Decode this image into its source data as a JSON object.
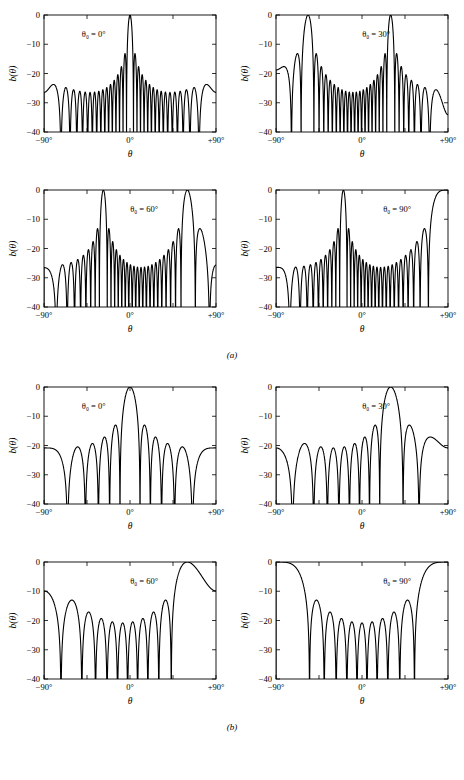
{
  "figure": {
    "caption_a": "(a)",
    "caption_b": "(b)",
    "axis": {
      "ylabel": "b(θ)",
      "xlabel": "θ",
      "yticks": [
        "0",
        "−10",
        "−20",
        "−30",
        "−40"
      ],
      "ytick_values": [
        0,
        -10,
        -20,
        -30,
        -40
      ],
      "xticks": [
        "−90°",
        "0°",
        "+90°"
      ],
      "xtick_values": [
        -90,
        0,
        90
      ],
      "xtick_minor_values": [
        -45,
        45
      ],
      "ylim": [
        -40,
        0
      ],
      "xlim": [
        -90,
        90
      ],
      "line_color": "#000000",
      "frame_color": "#000000"
    },
    "annotations": {
      "theta0_0": "θ₀ = 0°",
      "theta0_30": "θ₀ = 30°",
      "theta0_60": "θ₀ = 60°",
      "theta0_90": "θ₀ = 90°"
    }
  },
  "chart_data": [
    {
      "id": "a-0",
      "type": "line",
      "group": "a",
      "title": "θ₀ = 0°",
      "xlabel": "θ",
      "ylabel": "b(θ)",
      "xlim": [
        -90,
        90
      ],
      "ylim": [
        -40,
        0
      ],
      "grid": false,
      "legend": "none",
      "steer_deg": 0,
      "n_elements": 21,
      "spacing_lambda": 0.75,
      "peak_db": 0,
      "first_sidelobe_db": -13,
      "mainlobe_centers_deg": [
        0
      ],
      "grating_lobe_centers_deg": [
        -78,
        78
      ],
      "sidelobe_peaks_db": [
        -13,
        -17,
        -18.5,
        -19.5,
        -20,
        -20.5,
        -20.5,
        -20.5,
        -20,
        -19.5,
        -18.5,
        -17,
        -13
      ]
    },
    {
      "id": "a-30",
      "type": "line",
      "group": "a",
      "title": "θ₀ = 30°",
      "xlabel": "θ",
      "ylabel": "b(θ)",
      "xlim": [
        -90,
        90
      ],
      "ylim": [
        -40,
        0
      ],
      "grid": false,
      "legend": "none",
      "steer_deg": 30,
      "n_elements": 21,
      "spacing_lambda": 0.75,
      "peak_db": 0,
      "first_sidelobe_db": -13,
      "mainlobe_centers_deg": [
        30
      ],
      "grating_lobe_centers_deg": [
        -38
      ],
      "sidelobe_peaks_db": [
        -13,
        -14,
        -17,
        -19,
        -20,
        -20.5,
        -20.5,
        -20,
        -19,
        -17,
        -14,
        -13
      ]
    },
    {
      "id": "a-60",
      "type": "line",
      "group": "a",
      "title": "θ₀ = 60°",
      "xlabel": "θ",
      "ylabel": "b(θ)",
      "xlim": [
        -90,
        90
      ],
      "ylim": [
        -40,
        0
      ],
      "grid": false,
      "legend": "none",
      "steer_deg": 60,
      "n_elements": 21,
      "spacing_lambda": 0.75,
      "peak_db": 0,
      "first_sidelobe_db": -13,
      "mainlobe_centers_deg": [
        60
      ],
      "grating_lobe_centers_deg": [
        -16
      ],
      "sidelobe_peaks_db": [
        -20.5,
        -20.5,
        -20,
        -20,
        -19.5,
        -19,
        -17,
        -13.5,
        -13,
        -14,
        -16,
        -19,
        -20
      ]
    },
    {
      "id": "a-90",
      "type": "line",
      "group": "a",
      "title": "θ₀ = 90°",
      "xlabel": "θ",
      "ylabel": "b(θ)",
      "xlim": [
        -90,
        90
      ],
      "ylim": [
        -40,
        0
      ],
      "grid": false,
      "legend": "none",
      "steer_deg": 90,
      "n_elements": 21,
      "spacing_lambda": 0.75,
      "peak_db": 0,
      "first_sidelobe_db": -13,
      "mainlobe_centers_deg": [
        90
      ],
      "grating_lobe_centers_deg": [
        -4
      ],
      "sidelobe_peaks_db": [
        -17,
        -19.5,
        -20,
        -20.5,
        -20.5,
        -20,
        -19,
        -17,
        -13.5,
        -13,
        -14,
        -17,
        -20,
        -20.5,
        -13
      ]
    },
    {
      "id": "b-0",
      "type": "line",
      "group": "b",
      "title": "θ₀ = 0°",
      "xlabel": "θ",
      "ylabel": "b(θ)",
      "xlim": [
        -90,
        90
      ],
      "ylim": [
        -40,
        0
      ],
      "grid": false,
      "legend": "none",
      "steer_deg": 0,
      "n_elements": 11,
      "spacing_lambda": 0.5,
      "peak_db": 0,
      "first_sidelobe_db": -13,
      "mainlobe_centers_deg": [
        0
      ],
      "grating_lobe_centers_deg": [],
      "sidelobe_peaks_db": [
        -13,
        -17,
        -19.5,
        -20.5,
        -20.5,
        -19.5,
        -17,
        -13
      ]
    },
    {
      "id": "b-30",
      "type": "line",
      "group": "b",
      "title": "θ₀ = 30°",
      "xlabel": "θ",
      "ylabel": "b(θ)",
      "xlim": [
        -90,
        90
      ],
      "ylim": [
        -40,
        0
      ],
      "grid": false,
      "legend": "none",
      "steer_deg": 30,
      "n_elements": 11,
      "spacing_lambda": 0.5,
      "peak_db": 0,
      "first_sidelobe_db": -13,
      "mainlobe_centers_deg": [
        30
      ],
      "grating_lobe_centers_deg": [],
      "sidelobe_peaks_db": [
        -21,
        -20.5,
        -20,
        -19.5,
        -17,
        -13,
        -13.5,
        -19.5
      ]
    },
    {
      "id": "b-60",
      "type": "line",
      "group": "b",
      "title": "θ₀ = 60°",
      "xlabel": "θ",
      "ylabel": "b(θ)",
      "xlim": [
        -90,
        90
      ],
      "ylim": [
        -40,
        0
      ],
      "grid": false,
      "legend": "none",
      "steer_deg": 60,
      "n_elements": 11,
      "spacing_lambda": 0.5,
      "peak_db": 0,
      "first_sidelobe_db": -13,
      "mainlobe_centers_deg": [
        60
      ],
      "grating_lobe_centers_deg": [],
      "sidelobe_peaks_db": [
        -14,
        -17,
        -19.5,
        -20.5,
        -20.5,
        -20,
        -17,
        -13
      ]
    },
    {
      "id": "b-90",
      "type": "line",
      "group": "b",
      "title": "θ₀ = 90°",
      "xlabel": "θ",
      "ylabel": "b(θ)",
      "xlim": [
        -90,
        90
      ],
      "ylim": [
        -40,
        0
      ],
      "grid": false,
      "legend": "none",
      "steer_deg": 90,
      "n_elements": 11,
      "spacing_lambda": 0.5,
      "peak_db": 0,
      "first_sidelobe_db": -13,
      "mainlobe_centers_deg": [
        90
      ],
      "grating_lobe_centers_deg": [],
      "sidelobe_peaks_db": [
        -13,
        -17,
        -19.5,
        -20.5,
        -20.5,
        -19.5,
        -17,
        -13
      ]
    }
  ]
}
